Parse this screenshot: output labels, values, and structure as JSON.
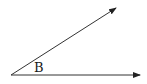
{
  "diagram": {
    "type": "angle",
    "vertex": {
      "x": 11,
      "y": 75
    },
    "rays": [
      {
        "name": "upper-ray",
        "end": {
          "x": 117,
          "y": 7
        }
      },
      {
        "name": "lower-ray",
        "end": {
          "x": 141,
          "y": 75
        }
      }
    ],
    "angle_label": "B",
    "line_color": "#222222"
  }
}
